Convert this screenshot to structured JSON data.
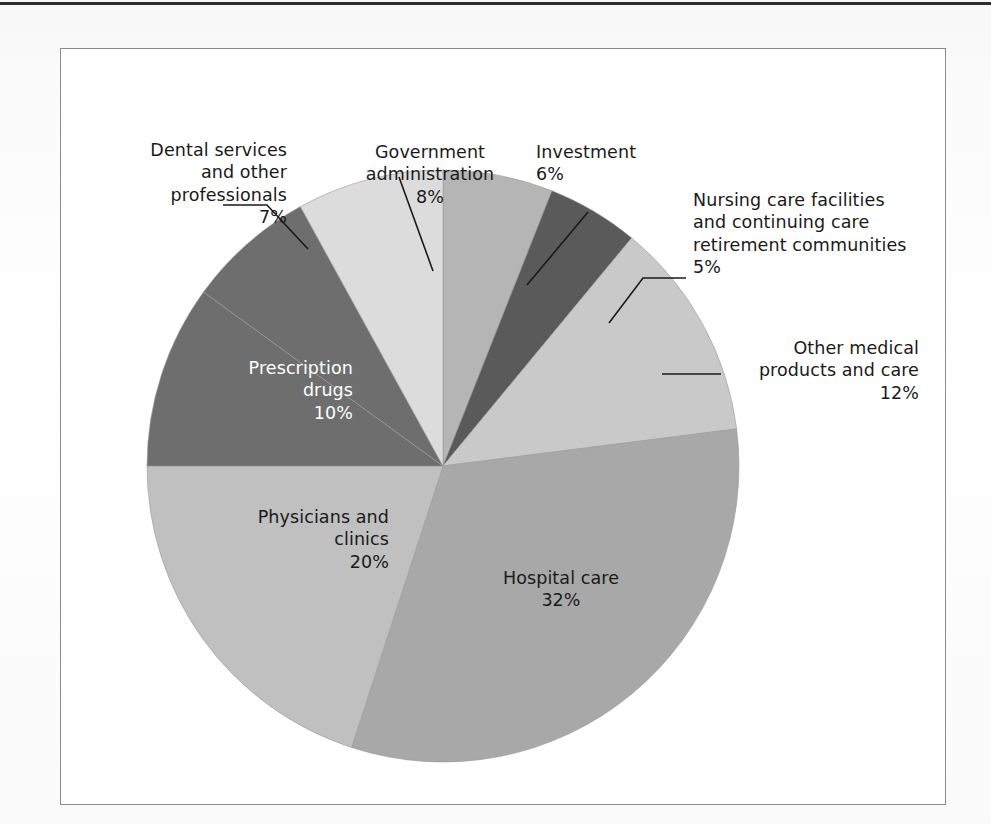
{
  "figure": {
    "frame_border_color": "#8c8c8c",
    "background": "#ffffff"
  },
  "chart_data": {
    "type": "pie",
    "title": "",
    "subtitle": "",
    "xlabel": "",
    "ylabel": "",
    "legend_position": "none",
    "grid": false,
    "units": "percent",
    "total": 100,
    "start_angle_deg": -90,
    "direction": "clockwise",
    "categories": [
      "Investment",
      "Nursing care facilities and continuing care retirement communities",
      "Other medical products and care",
      "Hospital care",
      "Physicians and clinics",
      "Prescription drugs",
      "Dental services and other professionals",
      "Government administration"
    ],
    "values": [
      6,
      5,
      12,
      32,
      20,
      10,
      7,
      8
    ],
    "colors": [
      "#b5b5b5",
      "#5a5a5a",
      "#c9c9c9",
      "#a8a8a8",
      "#c0c0c0",
      "#6e6e6e",
      "#6e6e6e",
      "#dcdcdc"
    ],
    "slices": [
      {
        "label": "Investment",
        "value": 6,
        "value_text": "6%",
        "color": "#b5b5b5",
        "label_placement": "callout",
        "label_text": "Investment\n6%"
      },
      {
        "label": "Nursing care facilities and continuing care retirement communities",
        "value": 5,
        "value_text": "5%",
        "color": "#5a5a5a",
        "label_placement": "callout",
        "label_text": "Nursing care facilities\nand continuing care\nretirement communities\n5%"
      },
      {
        "label": "Other medical products and care",
        "value": 12,
        "value_text": "12%",
        "color": "#c9c9c9",
        "label_placement": "callout",
        "label_text": "Other medical\nproducts and care\n12%"
      },
      {
        "label": "Hospital care",
        "value": 32,
        "value_text": "32%",
        "color": "#a8a8a8",
        "label_placement": "inside",
        "label_text": "Hospital care\n32%"
      },
      {
        "label": "Physicians and clinics",
        "value": 20,
        "value_text": "20%",
        "color": "#c0c0c0",
        "label_placement": "inside",
        "label_text": "Physicians and\nclinics\n20%"
      },
      {
        "label": "Prescription drugs",
        "value": 10,
        "value_text": "10%",
        "color": "#6e6e6e",
        "label_placement": "inside",
        "label_text": "Prescription\ndrugs\n10%"
      },
      {
        "label": "Dental services and other professionals",
        "value": 7,
        "value_text": "7%",
        "color": "#6e6e6e",
        "label_placement": "callout",
        "label_text": "Dental services\nand other\nprofessionals\n7%"
      },
      {
        "label": "Government administration",
        "value": 8,
        "value_text": "8%",
        "color": "#dcdcdc",
        "label_placement": "callout",
        "label_text": "Government\nadministration\n8%"
      }
    ]
  }
}
